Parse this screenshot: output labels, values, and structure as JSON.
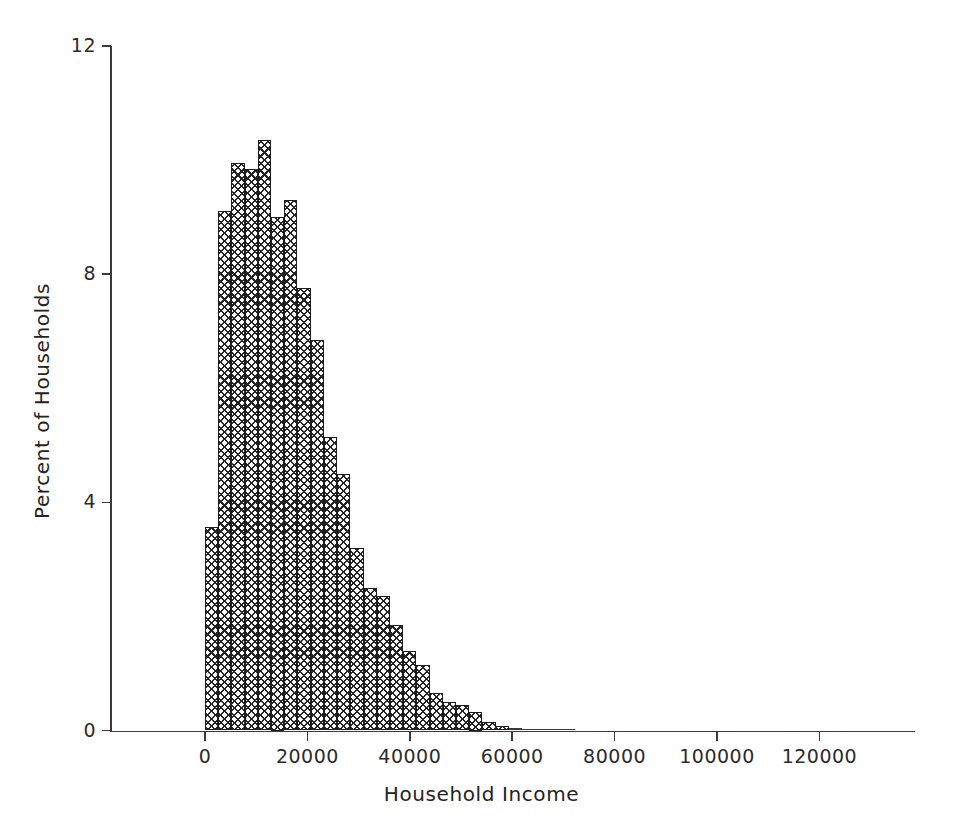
{
  "chart_data": {
    "type": "bar",
    "title": "",
    "subtitle": "",
    "xlabel": "Household Income",
    "ylabel": "Percent of Households",
    "xlim": [
      -15000,
      138000
    ],
    "ylim": [
      0,
      12
    ],
    "grid": false,
    "legend_position": "none",
    "x_ticks": [
      0,
      20000,
      40000,
      60000,
      80000,
      100000,
      120000
    ],
    "x_tick_labels": [
      "0",
      "20000",
      "40000",
      "60000",
      "80000",
      "100000",
      "120000"
    ],
    "y_ticks": [
      0,
      4,
      8,
      12
    ],
    "y_tick_labels": [
      "0",
      "4",
      "8",
      "12"
    ],
    "bin_width": 2580,
    "bin_starts": [
      0,
      2580,
      5160,
      7740,
      10320,
      12900,
      15480,
      18060,
      20640,
      23220,
      25800,
      28380,
      30960,
      33540,
      36120,
      38700,
      41280,
      43860,
      46440,
      49020,
      51600,
      54180,
      56760,
      59340,
      61920,
      64500,
      67080,
      69660
    ],
    "categories": [
      "0-2580",
      "2580-5160",
      "5160-7740",
      "7740-10320",
      "10320-12900",
      "12900-15480",
      "15480-18060",
      "18060-20640",
      "20640-23220",
      "23220-25800",
      "25800-28380",
      "28380-30960",
      "30960-33540",
      "33540-36120",
      "36120-38700",
      "38700-41280",
      "41280-43860",
      "43860-46440",
      "46440-49020",
      "49020-51600",
      "51600-54180",
      "54180-56760",
      "56760-59340",
      "59340-61920",
      "61920-64500",
      "64500-67080",
      "67080-69660",
      "69660-72240"
    ],
    "values": [
      3.57,
      9.1,
      9.95,
      9.85,
      10.35,
      9.0,
      9.3,
      7.75,
      6.85,
      5.15,
      4.5,
      3.2,
      2.5,
      2.35,
      1.85,
      1.4,
      1.15,
      0.65,
      0.5,
      0.45,
      0.32,
      0.15,
      0.08,
      0.05,
      0.03,
      0.02,
      0.01,
      0.01
    ],
    "series": [
      {
        "name": "Percent of Households",
        "values": [
          3.57,
          9.1,
          9.95,
          9.85,
          10.35,
          9.0,
          9.3,
          7.75,
          6.85,
          5.15,
          4.5,
          3.2,
          2.5,
          2.35,
          1.85,
          1.4,
          1.15,
          0.65,
          0.5,
          0.45,
          0.32,
          0.15,
          0.08,
          0.05,
          0.03,
          0.02,
          0.01,
          0.01
        ]
      }
    ],
    "bar_fill": "cross-hatch",
    "bar_edge_color": "#1d1d1d",
    "axis_color": "#3a3a3a"
  }
}
